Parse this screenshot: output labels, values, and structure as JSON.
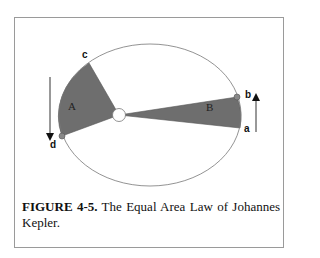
{
  "figure": {
    "caption_label": "FIGURE 4-5.",
    "caption_text": "The Equal Area Law of Johannes Kepler.",
    "areas": {
      "A": "A",
      "B": "B"
    },
    "points": {
      "a": "a",
      "b": "b",
      "c": "c",
      "d": "d"
    },
    "colors": {
      "sector_fill": "#6e6e6e",
      "orbit_stroke": "#777777",
      "sun_fill": "#ffffff",
      "frame": "#9a9a9a"
    }
  }
}
